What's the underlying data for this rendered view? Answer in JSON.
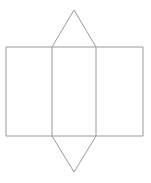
{
  "figure": {
    "name": "triangular-prism-net",
    "canvas": {
      "width": 151,
      "height": 183,
      "background": "#ffffff"
    },
    "stroke": {
      "color": "#9a9a9a",
      "width": 1
    },
    "fill": "#ffffff",
    "geometry": {
      "rectangle": {
        "left": 6,
        "top": 47,
        "right": 143,
        "bottom": 136
      },
      "divider_x": [
        52,
        96
      ],
      "top_apex": {
        "x": 74,
        "y": 10
      },
      "bottom_apex": {
        "x": 74,
        "y": 172
      }
    },
    "parts": [
      {
        "name": "left-rectangle-face",
        "label": ""
      },
      {
        "name": "middle-rectangle-face",
        "label": ""
      },
      {
        "name": "right-rectangle-face",
        "label": ""
      },
      {
        "name": "top-triangle-face",
        "label": ""
      },
      {
        "name": "bottom-triangle-face",
        "label": ""
      }
    ]
  },
  "caption": {
    "text": ""
  }
}
